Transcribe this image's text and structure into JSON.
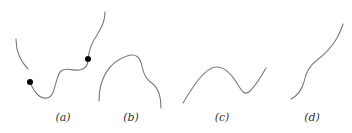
{
  "figure": {
    "panels": [
      {
        "id": "a",
        "label": "(a)",
        "label_x": 63,
        "description": "broken curve with two marked points"
      },
      {
        "id": "b",
        "label": "(b)",
        "label_x": 131,
        "description": "arch-shaped curve"
      },
      {
        "id": "c",
        "label": "(c)",
        "label_x": 222,
        "description": "curve with one peak and one trough"
      },
      {
        "id": "d",
        "label": "(d)",
        "label_x": 312,
        "description": "monotone increasing wavy curve"
      }
    ],
    "colors": {
      "curve": "#7a7a7a",
      "point": "#000000",
      "label": "#333333",
      "background": "#ffffff"
    }
  }
}
